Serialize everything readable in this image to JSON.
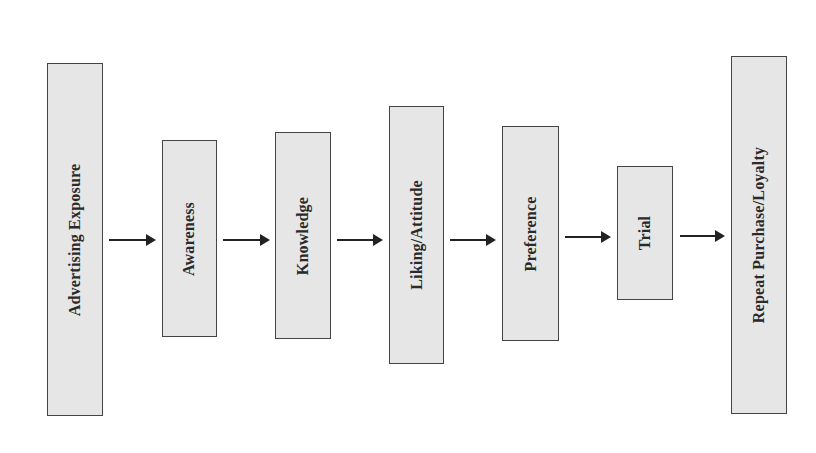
{
  "diagram": {
    "type": "flow",
    "direction": "left-to-right",
    "stages": [
      {
        "label": "Advertising Exposure"
      },
      {
        "label": "Awareness"
      },
      {
        "label": "Knowledge"
      },
      {
        "label": "Liking/Attitude"
      },
      {
        "label": "Preference"
      },
      {
        "label": "Trial"
      },
      {
        "label": "Repeat Purchase/Loyalty"
      }
    ],
    "colors": {
      "box_fill": "#e6e6e6",
      "border": "#444444",
      "arrow": "#222222"
    }
  }
}
